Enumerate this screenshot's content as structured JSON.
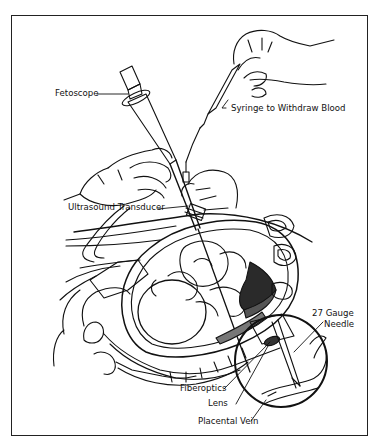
{
  "figure": {
    "labels": {
      "fetoscope": "Fetoscope",
      "syringe": "Syringe to Withdraw Blood",
      "ultrasound_transducer": "Ultrasound Transducer",
      "gauge_needle_line1": "27 Gauge",
      "gauge_needle_line2": "Needle",
      "fiberoptics": "Fiberoptics",
      "lens": "Lens",
      "placental_vein": "Placental Vein"
    },
    "inset": {
      "shape": "circle",
      "description": "magnified view of fetoscope tip with needle entering placental vein"
    },
    "colors": {
      "line": "#111111",
      "background": "#ffffff",
      "frame": "#222222"
    },
    "caption_cutoff": ""
  }
}
